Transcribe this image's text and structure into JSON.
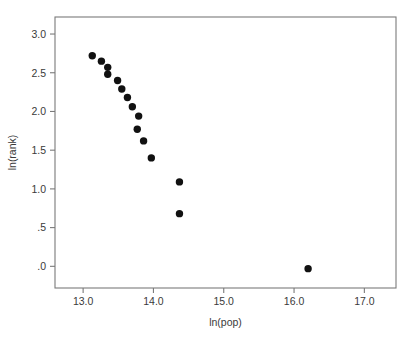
{
  "chart_data": {
    "type": "scatter",
    "title": "",
    "xlabel": "ln(pop)",
    "ylabel": "ln(rank)",
    "xlim": [
      12.6,
      17.45
    ],
    "ylim": [
      -0.28,
      3.22
    ],
    "grid": false,
    "legend": null,
    "xticks": [
      13.0,
      14.0,
      15.0,
      16.0,
      17.0
    ],
    "xticklabels": [
      "13.0",
      "14.0",
      "15.0",
      "16.0",
      "17.0"
    ],
    "yticks": [
      0.0,
      0.5,
      1.0,
      1.5,
      2.0,
      2.5,
      3.0
    ],
    "yticklabels": [
      ".0",
      ".5",
      "1.0",
      "1.5",
      "2.0",
      "2.5",
      "3.0"
    ],
    "marker": "filled-circle",
    "marker_color": "#111111",
    "marker_size": 5.2,
    "series": [
      {
        "name": "cities",
        "x": [
          13.13,
          13.26,
          13.35,
          13.35,
          13.49,
          13.55,
          13.63,
          13.7,
          13.77,
          13.79,
          13.86,
          13.97,
          14.37,
          14.37,
          16.2
        ],
        "y": [
          2.72,
          2.65,
          2.57,
          2.48,
          2.4,
          2.29,
          2.18,
          2.06,
          1.77,
          1.94,
          1.62,
          1.4,
          1.09,
          0.68,
          -0.03
        ]
      }
    ]
  },
  "figure": {
    "background_color": "#ffffff",
    "frame_color": "#7a7a7a",
    "text_color": "#3a3a3a"
  }
}
